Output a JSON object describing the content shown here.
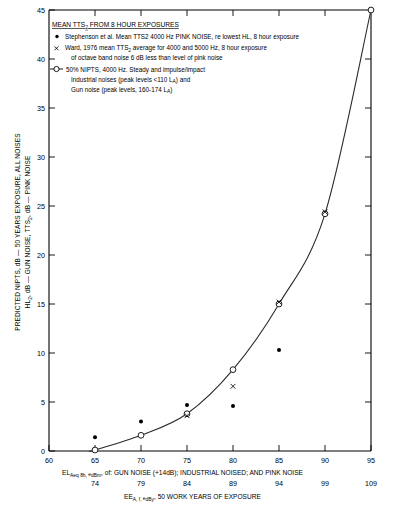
{
  "chart_data": {
    "type": "scatter",
    "title": "MEAN TTS2 FROM 8 HOUR EXPOSURES",
    "title_display": "MEAN TTS",
    "title_sub": "2",
    "title_rest": " FROM 8 HOUR EXPOSURES",
    "grid": false,
    "legend_position": "upper-left-inside",
    "xlabel": "EL Aeq 8h, edBm of: GUN NOISE (+14dB); INDUSTRIAL NOISED; AND PINK NOISE",
    "xlabel2": "EE A, f, edBy: 50 WORK YEARS OF EXPOSURE",
    "ylabel_line1": "PREDICTED NIPTS, dB — 50 YEARS EXPOSURE, ALL NOISES",
    "ylabel_line2": "HL2, dB — GUN NOISE, TTS2, dB — PINK NOISE",
    "xlim": [
      60,
      95
    ],
    "ylim": [
      0,
      45
    ],
    "xticks": [
      60,
      65,
      70,
      75,
      80,
      85,
      90,
      95
    ],
    "xticklabels": [
      "60",
      "65",
      "70",
      "75",
      "80",
      "85",
      "90",
      "95"
    ],
    "xticklabels_secondary": [
      "74",
      "79",
      "84",
      "89",
      "94",
      "99",
      "109"
    ],
    "xticks_secondary": [
      65,
      70,
      75,
      80,
      85,
      90,
      95
    ],
    "yticks": [
      0,
      5,
      10,
      15,
      20,
      25,
      30,
      35,
      40,
      45
    ],
    "yticklabels": [
      "0",
      "5",
      "10",
      "15",
      "20",
      "25",
      "30",
      "35",
      "40",
      "45"
    ],
    "series": [
      {
        "name": "Stephenson et al. Mean TTS2 4000 Hz PINK NOISE, re lowest HL, 8 hour exposure",
        "marker": "filled-dot",
        "x": [
          65,
          70,
          75,
          80,
          85
        ],
        "y": [
          1.4,
          3.0,
          4.7,
          4.6,
          10.3
        ]
      },
      {
        "name": "Ward, 1976 mean TTS2 average for 4000 and 5000 Hz, 8 hour exposure of octave band noise 6 dB less than level of pink noise",
        "marker": "x",
        "x": [
          75,
          80,
          85,
          90
        ],
        "y": [
          3.6,
          6.6,
          15.2,
          24.4
        ]
      },
      {
        "name": "50% NIPTS, 4000 Hz. Steady and impulse/impact Industrial noises (peak levels <110 LA) and Gun noise (peak levels, 160-174 LA)",
        "marker": "open-circle-line",
        "x": [
          65,
          70,
          75,
          80,
          85,
          90,
          95
        ],
        "y": [
          0.1,
          1.6,
          3.8,
          8.3,
          15.0,
          24.2,
          45.0
        ]
      }
    ]
  },
  "legend": {
    "title": "MEAN TTS",
    "title_sub": "2",
    "title_rest": " FROM 8 HOUR EXPOSURES",
    "entries": [
      {
        "marker": "filled-dot",
        "lines": [
          "Stephenson et al. Mean TTS2 4000 Hz PINK NOISE, re  lowest HL, 8 hour exposure"
        ]
      },
      {
        "marker": "x",
        "lines": [
          "Ward, 1976  mean TTS",
          "2",
          " average for 4000 and 5000  Hz, 8 hour exposure",
          "of octave band noise 6 dB less than level of pink noise"
        ]
      },
      {
        "marker": "circle-line",
        "lines": [
          "50% NIPTS, 4000 Hz. Steady and impulse/impact",
          "Industrial noises (peak levels <110 L",
          "A",
          ") and",
          "Gun noise (peak levels, 160-174 L",
          "A",
          ")"
        ]
      }
    ]
  },
  "colors": {
    "axis": "#000000",
    "curve": "#2b2b2b",
    "marker_fill": "#000000",
    "marker_open": "#ffffff",
    "background": "#ffffff"
  }
}
